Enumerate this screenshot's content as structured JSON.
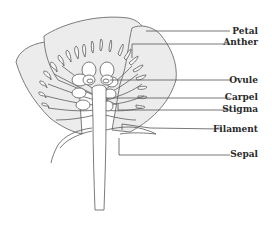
{
  "diagram": {
    "labels": [
      {
        "text": "Petal",
        "y": 34,
        "line_from_x": 146,
        "line_from_y": 31
      },
      {
        "text": "Anther",
        "y": 45,
        "line_from_x": 132,
        "line_from_y": 44
      },
      {
        "text": "Ovule",
        "y": 83,
        "line_from_x": 110,
        "line_from_y": 80
      },
      {
        "text": "Carpel",
        "y": 100,
        "line_from_x": 106,
        "line_from_y": 98
      },
      {
        "text": "Stigma",
        "y": 112,
        "line_from_x": 118,
        "line_from_y": 110
      },
      {
        "text": "Filament",
        "y": 132,
        "line_from_x": 150,
        "line_from_y": 129
      },
      {
        "text": "Sepal",
        "y": 157,
        "line_from_x": 119,
        "line_from_y": 154
      }
    ],
    "colors": {
      "petal_fill": "#ececec",
      "outline": "#6e6e6e",
      "label": "#2a2a2a"
    }
  }
}
